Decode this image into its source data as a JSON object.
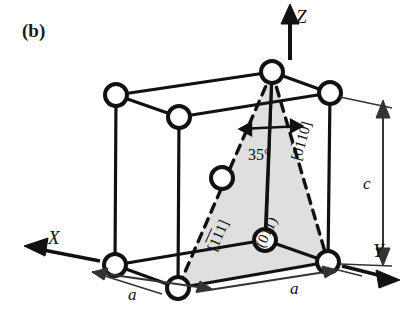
{
  "figure": {
    "panel_label": "(b)",
    "caption_present": false
  },
  "axes": [
    {
      "name": "x-axis",
      "label": "X",
      "direction": "lower-left"
    },
    {
      "name": "y-axis",
      "label": "Y",
      "direction": "lower-right"
    },
    {
      "name": "z-axis",
      "label": "Z",
      "direction": "up"
    }
  ],
  "dimensions": [
    {
      "name": "lattice-a-left",
      "label": "a",
      "edge": "bottom-left"
    },
    {
      "name": "lattice-a-right",
      "label": "a",
      "edge": "bottom-right"
    },
    {
      "name": "lattice-c",
      "label": "c",
      "edge": "vertical-right"
    }
  ],
  "angle": {
    "value": "35",
    "unit": "°",
    "label": "35°"
  },
  "crystallographic_labels": {
    "direction_0110": {
      "name": "direction-0110",
      "glyphs": [
        {
          "char": "[",
          "overbar": false
        },
        {
          "char": "0",
          "overbar": false
        },
        {
          "char": "1",
          "overbar": true
        },
        {
          "char": "1",
          "overbar": false
        },
        {
          "char": "0",
          "overbar": false
        },
        {
          "char": "]",
          "overbar": false
        }
      ],
      "plain": "[0110]"
    },
    "direction_111": {
      "name": "direction-111",
      "glyphs": [
        {
          "char": "[",
          "overbar": false
        },
        {
          "char": "1",
          "overbar": true
        },
        {
          "char": "1",
          "overbar": true
        },
        {
          "char": "1",
          "overbar": false
        },
        {
          "char": "]",
          "overbar": false
        }
      ],
      "plain": "[111]"
    },
    "plane_011": {
      "name": "plane-011",
      "glyphs": [
        {
          "char": "(",
          "overbar": false
        },
        {
          "char": "0",
          "overbar": false
        },
        {
          "char": "1",
          "overbar": false
        },
        {
          "char": "1",
          "overbar": false
        },
        {
          "char": ")",
          "overbar": false
        }
      ],
      "plain": "(011)"
    }
  },
  "colors": {
    "line": "#111111",
    "atom_fill": "#ffffff",
    "atom_stroke": "#111111",
    "plane_fill": "#d9d9d9",
    "background": "#ffffff",
    "dimension_line": "#333333"
  },
  "geometry": {
    "atoms": [
      {
        "name": "atom-top-apex",
        "cx": 272,
        "cy": 72,
        "r": 11
      },
      {
        "name": "atom-top-back-left",
        "cx": 116,
        "cy": 95,
        "r": 11
      },
      {
        "name": "atom-top-back-center",
        "cx": 179,
        "cy": 117,
        "r": 11
      },
      {
        "name": "atom-top-right",
        "cx": 330,
        "cy": 93,
        "r": 11
      },
      {
        "name": "atom-mid-left-face",
        "cx": 222,
        "cy": 178,
        "r": 11
      },
      {
        "name": "atom-bottom-front-mid",
        "cx": 265,
        "cy": 240,
        "r": 11
      },
      {
        "name": "atom-bottom-left",
        "cx": 115,
        "cy": 265,
        "r": 11
      },
      {
        "name": "atom-bottom-back-mid",
        "cx": 178,
        "cy": 288,
        "r": 11
      },
      {
        "name": "atom-bottom-right",
        "cx": 328,
        "cy": 262,
        "r": 11
      }
    ]
  }
}
